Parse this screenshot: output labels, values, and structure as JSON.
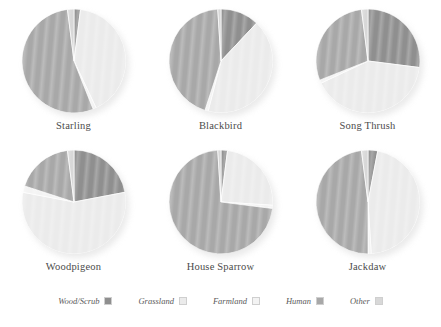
{
  "figure": {
    "title": "",
    "legend_position": "bottom"
  },
  "legend": {
    "items": [
      {
        "label": "Wood/Scrub",
        "color": "#8f8f8f",
        "swatch_name": "legend-swatch-wood-scrub"
      },
      {
        "label": "Grassland",
        "color": "#ebebeb",
        "swatch_name": "legend-swatch-grassland"
      },
      {
        "label": "Farmland",
        "color": "#f3f3f3",
        "swatch_name": "legend-swatch-farmland"
      },
      {
        "label": "Human",
        "color": "#a8a8a8",
        "swatch_name": "legend-swatch-human"
      },
      {
        "label": "Other",
        "color": "#d8d8d8",
        "swatch_name": "legend-swatch-other"
      }
    ]
  },
  "chart_data": {
    "type": "pie",
    "title": "",
    "xlabel": "",
    "ylabel": "",
    "categories": [
      "Wood/Scrub",
      "Grassland",
      "Farmland",
      "Human",
      "Other"
    ],
    "colors": [
      "#8f8f8f",
      "#ebebeb",
      "#f3f3f3",
      "#a8a8a8",
      "#d8d8d8"
    ],
    "units": "percent",
    "start_angle_deg": 0,
    "direction": "clockwise",
    "panels": [
      {
        "name": "Starling",
        "values": [
          2,
          41,
          1,
          54,
          2
        ],
        "series": [
          {
            "name": "Wood/Scrub",
            "value": 2
          },
          {
            "name": "Grassland",
            "value": 41
          },
          {
            "name": "Farmland",
            "value": 1
          },
          {
            "name": "Human",
            "value": 54
          },
          {
            "name": "Other",
            "value": 2
          }
        ]
      },
      {
        "name": "Blackbird",
        "values": [
          12,
          42,
          1,
          44,
          1
        ],
        "series": [
          {
            "name": "Wood/Scrub",
            "value": 12
          },
          {
            "name": "Grassland",
            "value": 42
          },
          {
            "name": "Farmland",
            "value": 1
          },
          {
            "name": "Human",
            "value": 44
          },
          {
            "name": "Other",
            "value": 1
          }
        ]
      },
      {
        "name": "Song Thrush",
        "values": [
          27,
          41,
          1,
          29,
          2
        ],
        "series": [
          {
            "name": "Wood/Scrub",
            "value": 27
          },
          {
            "name": "Grassland",
            "value": 41
          },
          {
            "name": "Farmland",
            "value": 1
          },
          {
            "name": "Human",
            "value": 29
          },
          {
            "name": "Other",
            "value": 2
          }
        ]
      },
      {
        "name": "Woodpigeon",
        "values": [
          22,
          56,
          2,
          18,
          2
        ],
        "series": [
          {
            "name": "Wood/Scrub",
            "value": 22
          },
          {
            "name": "Grassland",
            "value": 56
          },
          {
            "name": "Farmland",
            "value": 2
          },
          {
            "name": "Human",
            "value": 18
          },
          {
            "name": "Other",
            "value": 2
          }
        ]
      },
      {
        "name": "House Sparrow",
        "values": [
          2,
          24,
          1,
          72,
          1
        ],
        "series": [
          {
            "name": "Wood/Scrub",
            "value": 2
          },
          {
            "name": "Grassland",
            "value": 24
          },
          {
            "name": "Farmland",
            "value": 1
          },
          {
            "name": "Human",
            "value": 72
          },
          {
            "name": "Other",
            "value": 1
          }
        ]
      },
      {
        "name": "Jackdaw",
        "values": [
          3,
          46,
          1,
          48,
          2
        ],
        "series": [
          {
            "name": "Wood/Scrub",
            "value": 3
          },
          {
            "name": "Grassland",
            "value": 46
          },
          {
            "name": "Farmland",
            "value": 1
          },
          {
            "name": "Human",
            "value": 48
          },
          {
            "name": "Other",
            "value": 2
          }
        ]
      }
    ]
  }
}
